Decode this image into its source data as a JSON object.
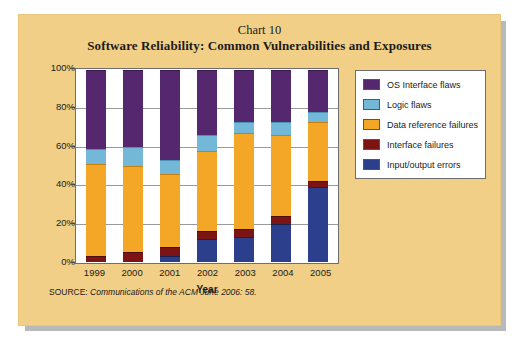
{
  "card": {
    "background_color": "#f2cf86",
    "shadow_color": "#b8b9bb"
  },
  "header": {
    "chart_number": "Chart 10",
    "title": "Software Reliability: Common Vulnerabilities and Exposures"
  },
  "source": {
    "label": "SOURCE:",
    "citation": "Communications of the ACM June 2006: 58."
  },
  "legend": {
    "items": [
      {
        "label": "OS Interface flaws",
        "color": "#54276f"
      },
      {
        "label": "Logic flaws",
        "color": "#74b8d8"
      },
      {
        "label": "Data reference failures",
        "color": "#f4a626"
      },
      {
        "label": "Interface failures",
        "color": "#7d1414"
      },
      {
        "label": "Input/output errors",
        "color": "#2b3f8c"
      }
    ]
  },
  "axes": {
    "y_ticks": [
      "0%",
      "20%",
      "40%",
      "60%",
      "80%",
      "100%"
    ],
    "x_title": "Year"
  },
  "chart_data": {
    "type": "bar",
    "stacked": true,
    "normalized_percent": true,
    "title": "Software Reliability: Common Vulnerabilities and Exposures",
    "subtitle": "Chart 10",
    "xlabel": "Year",
    "ylabel": "",
    "ylim": [
      0,
      100
    ],
    "ytick_labels": [
      "0%",
      "20%",
      "40%",
      "60%",
      "80%",
      "100%"
    ],
    "ytick_values": [
      0,
      20,
      40,
      60,
      80,
      100
    ],
    "grid": true,
    "legend_position": "right",
    "categories": [
      "1999",
      "2000",
      "2001",
      "2002",
      "2003",
      "2004",
      "2005"
    ],
    "series": [
      {
        "name": "Input/output errors",
        "color": "#2b3f8c",
        "values": [
          0,
          0,
          3,
          12,
          13,
          20,
          39
        ]
      },
      {
        "name": "Interface failures",
        "color": "#7d1414",
        "values": [
          3,
          5,
          5,
          4,
          4,
          4,
          3
        ]
      },
      {
        "name": "Data reference failures",
        "color": "#f4a626",
        "values": [
          48,
          45,
          38,
          42,
          50,
          42,
          31
        ]
      },
      {
        "name": "Logic flaws",
        "color": "#74b8d8",
        "values": [
          8,
          10,
          7,
          8,
          6,
          7,
          5
        ]
      },
      {
        "name": "OS Interface flaws",
        "color": "#54276f",
        "values": [
          41,
          40,
          47,
          34,
          27,
          27,
          22
        ]
      }
    ]
  }
}
